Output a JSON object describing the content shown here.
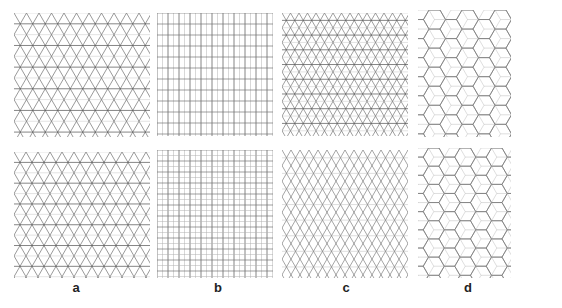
{
  "figure": {
    "background": "#ffffff",
    "line_color": "#555555",
    "faint_line_color": "#b0b0b0",
    "columns": [
      {
        "id": "a",
        "label": "a",
        "label_x": 76,
        "pattern": "triangular-kagome"
      },
      {
        "id": "b",
        "label": "b",
        "label_x": 218,
        "pattern": "rectangular-grid"
      },
      {
        "id": "c",
        "label": "c",
        "label_x": 346,
        "pattern": "triangular-dense"
      },
      {
        "id": "d",
        "label": "d",
        "label_x": 468,
        "pattern": "hexagonal-cube"
      }
    ],
    "label_y": 280,
    "panels": [
      {
        "name": "panel-a-top",
        "col": "a",
        "row": "top",
        "x": 14,
        "y": 13,
        "w": 136,
        "h": 124,
        "type": "tri",
        "spacing": 12.5,
        "opacity": 0.85,
        "horiz": true
      },
      {
        "name": "panel-b-top",
        "col": "b",
        "row": "top",
        "x": 157,
        "y": 13,
        "w": 116,
        "h": 123,
        "type": "rect",
        "dx": 5.5,
        "dy": 11,
        "major_every": 2
      },
      {
        "name": "panel-c-top",
        "col": "c",
        "row": "top",
        "x": 282,
        "y": 13,
        "w": 126,
        "h": 123,
        "type": "tri",
        "spacing": 8.5,
        "opacity": 0.8,
        "horiz": true
      },
      {
        "name": "panel-d-top",
        "col": "d",
        "row": "top",
        "x": 418,
        "y": 10,
        "w": 93,
        "h": 127,
        "type": "hex",
        "size": 11
      },
      {
        "name": "panel-a-bottom",
        "col": "a",
        "row": "bottom",
        "x": 14,
        "y": 152,
        "w": 136,
        "h": 126,
        "type": "tri",
        "spacing": 12,
        "opacity": 0.85,
        "horiz": true
      },
      {
        "name": "panel-b-bottom",
        "col": "b",
        "row": "bottom",
        "x": 157,
        "y": 150,
        "w": 116,
        "h": 128,
        "type": "rect",
        "dx": 5.5,
        "dy": 5.5,
        "major_every": 2
      },
      {
        "name": "panel-c-bottom",
        "col": "c",
        "row": "bottom",
        "x": 282,
        "y": 150,
        "w": 126,
        "h": 128,
        "type": "tri",
        "spacing": 9,
        "opacity": 0.75,
        "horiz": false
      },
      {
        "name": "panel-d-bottom",
        "col": "d",
        "row": "bottom",
        "x": 418,
        "y": 148,
        "w": 93,
        "h": 130,
        "type": "hex",
        "size": 10.5
      }
    ]
  }
}
